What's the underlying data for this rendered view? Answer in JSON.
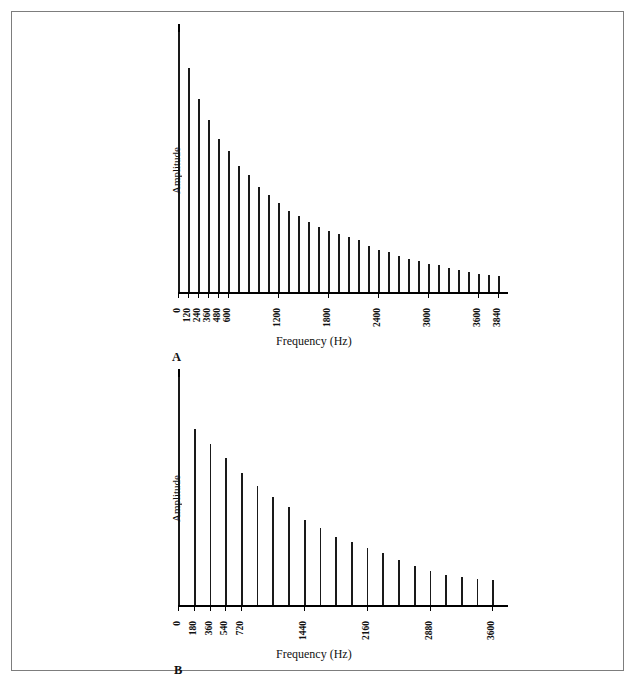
{
  "figure": {
    "panels": [
      {
        "letter": "A",
        "ylabel": "Amplitude",
        "xlabel": "Frequency (Hz)",
        "tick_labels": [
          "0",
          "120",
          "240",
          "360",
          "480",
          "600",
          "1200",
          "1800",
          "2400",
          "3000",
          "3600",
          "3840"
        ]
      },
      {
        "letter": "B",
        "ylabel": "Amplitude",
        "xlabel": "Frequency (Hz)",
        "tick_labels": [
          "0",
          "180",
          "360",
          "540",
          "720",
          "1440",
          "2160",
          "2880",
          "3600"
        ]
      }
    ]
  },
  "chart_data": [
    {
      "type": "bar",
      "title": "",
      "subtitle": "",
      "panel": "A",
      "xlabel": "Frequency (Hz)",
      "ylabel": "Amplitude",
      "grid": false,
      "legend": false,
      "xlim": [
        0,
        3960
      ],
      "ylim": [
        0,
        100
      ],
      "xtick_values": [
        0,
        120,
        240,
        360,
        480,
        600,
        1200,
        1800,
        2400,
        3000,
        3600,
        3840
      ],
      "xtick_labels": [
        "0",
        "120",
        "240",
        "360",
        "480",
        "600",
        "1200",
        "1800",
        "2400",
        "3000",
        "3600",
        "3840"
      ],
      "ytick_labels": [],
      "categories": [
        0,
        120,
        240,
        360,
        480,
        600,
        720,
        840,
        960,
        1080,
        1200,
        1320,
        1440,
        1560,
        1680,
        1800,
        1920,
        2040,
        2160,
        2280,
        2400,
        2520,
        2640,
        2760,
        2880,
        3000,
        3120,
        3240,
        3360,
        3480,
        3600,
        3720,
        3840
      ],
      "values": [
        100,
        86.5,
        74.5,
        66.5,
        59.0,
        54.5,
        48.5,
        45.0,
        40.5,
        37.5,
        34.5,
        31.5,
        29.5,
        27.0,
        25.0,
        23.5,
        22.5,
        21.5,
        20.0,
        18.0,
        16.5,
        15.5,
        14.0,
        13.0,
        12.0,
        11.0,
        10.5,
        9.5,
        8.5,
        8.0,
        7.2,
        6.8,
        6.3
      ],
      "notes": "Line spectrum; fundamental 120 Hz, 33 harmonics, monotonically decaying envelope"
    },
    {
      "type": "bar",
      "title": "",
      "subtitle": "",
      "panel": "B",
      "xlabel": "Frequency (Hz)",
      "ylabel": "Amplitude",
      "grid": false,
      "legend": false,
      "xlim": [
        0,
        3780
      ],
      "ylim": [
        0,
        100
      ],
      "xtick_values": [
        0,
        180,
        360,
        540,
        720,
        1440,
        2160,
        2880,
        3600
      ],
      "xtick_labels": [
        "0",
        "180",
        "360",
        "540",
        "720",
        "1440",
        "2160",
        "2880",
        "3600"
      ],
      "ytick_labels": [],
      "categories": [
        0,
        180,
        360,
        540,
        720,
        900,
        1080,
        1260,
        1440,
        1620,
        1800,
        1980,
        2160,
        2340,
        2520,
        2700,
        2880,
        3060,
        3240,
        3420,
        3600
      ],
      "values": [
        100,
        77.5,
        71.0,
        64.5,
        58.0,
        52.5,
        47.5,
        43.0,
        37.5,
        34.0,
        30.0,
        28.0,
        25.0,
        23.0,
        20.0,
        17.5,
        15.0,
        13.5,
        12.5,
        11.5,
        11.0
      ],
      "notes": "Line spectrum; fundamental 180 Hz, 21 harmonics, monotonically decaying envelope"
    }
  ]
}
